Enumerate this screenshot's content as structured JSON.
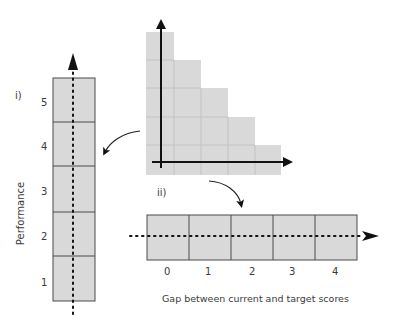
{
  "figure": {
    "panel_i_label": "i)",
    "panel_ii_label": "ii)",
    "y_axis_label": "Performance",
    "x_axis_label": "Gap between current and target scores",
    "vertical_scale": [
      "5",
      "4",
      "3",
      "2",
      "1"
    ],
    "horizontal_scale": [
      "0",
      "1",
      "2",
      "3",
      "4"
    ],
    "staircase_column_heights": [
      5,
      4,
      3,
      2,
      1
    ],
    "colors": {
      "cell_fill": "#d9d9d9",
      "cell_border": "#4a4a4a",
      "grid_line": "#c4c4c4",
      "axis": "#111111"
    }
  }
}
